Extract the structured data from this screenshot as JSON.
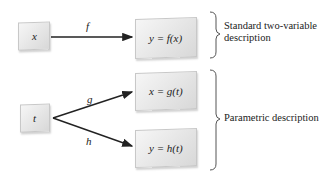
{
  "diagram": {
    "standard": {
      "input": "x",
      "function_label": "f",
      "output": "y = f(x)",
      "description": "Standard two-variable description"
    },
    "parametric": {
      "input": "t",
      "upper_function_label": "g",
      "upper_output": "x = g(t)",
      "lower_function_label": "h",
      "lower_output": "y = h(t)",
      "description": "Parametric description"
    }
  },
  "colors": {
    "arrow": "#222222",
    "brace": "#555555",
    "box_fill": "#e6e6e6"
  }
}
